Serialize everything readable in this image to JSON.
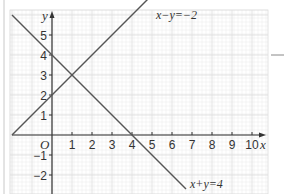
{
  "chart_data": {
    "type": "line",
    "title": "",
    "xlabel": "x",
    "ylabel": "y",
    "origin_label": "O",
    "xlim": [
      -2,
      10.5
    ],
    "ylim": [
      -3,
      6
    ],
    "grid": true,
    "x_ticks": [
      1,
      2,
      3,
      4,
      5,
      6,
      7,
      8,
      9,
      10
    ],
    "y_ticks": [
      -2,
      -1,
      1,
      2,
      3,
      4,
      5
    ],
    "x_tick_labels": [
      "1",
      "2",
      "3",
      "4",
      "5",
      "6",
      "7",
      "8",
      "9",
      "10"
    ],
    "y_tick_labels": [
      "−2",
      "−1",
      "1",
      "2",
      "3",
      "4",
      "5"
    ],
    "series": [
      {
        "name": "x−y=−2",
        "equation": "y = x + 2",
        "x": [
          -2,
          5
        ],
        "y": [
          0,
          7
        ],
        "label_position": [
          5.2,
          5.9
        ]
      },
      {
        "name": "x+y=4",
        "equation": "y = 4 - x",
        "x": [
          -2,
          6.7
        ],
        "y": [
          6,
          -2.7
        ],
        "label_position": [
          6.9,
          -2.6
        ]
      }
    ],
    "intersection": {
      "x": 1,
      "y": 3
    },
    "colors": {
      "line": "#555555",
      "axis": "#333333",
      "grid_major": "#dcdcdc",
      "grid_minor": "#efefef",
      "text": "#333333"
    }
  }
}
